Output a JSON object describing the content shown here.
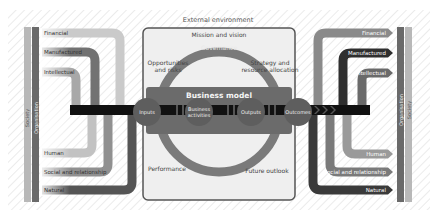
{
  "title": "External environment",
  "center": {
    "mission": "Mission and vision",
    "governance": "Governance",
    "opportunities_line1": "Opportunities",
    "opportunities_line2": "and risks",
    "strategy_line1": "Strategy and",
    "strategy_line2": "resource allocation",
    "business_model": "Business model",
    "inputs": "Inputs",
    "activities_line1": "Business",
    "activities_line2": "activities",
    "outputs": "Outputs",
    "outcomes": "Outcomes",
    "performance": "Performance",
    "outlook": "Future outlook"
  },
  "left_capitals": [
    "Financial",
    "Manufactured",
    "Intellectual",
    "Human",
    "Social and relationship",
    "Natural"
  ],
  "right_capitals": [
    "Financial",
    "Manufactured",
    "Intellectual",
    "Human",
    "Social and relationship",
    "Natural"
  ],
  "left_bars": {
    "society": "Society",
    "organisation": "Organisation"
  },
  "right_bars": {
    "society": "Society",
    "organisation": "Organisation"
  },
  "colors": {
    "financial": "#c9c9c9",
    "manufactured": "#6e6e6e",
    "intellectual": "#a5a5a5",
    "human": "#bdbdbd",
    "social": "#8c8c8c",
    "natural": "#5a5a5a",
    "main_flow": "#111111",
    "circle_node": "#5e5e5e",
    "business_model_band": "#6b6b6b",
    "arc": "#777777",
    "panel_bg": "#eeeeee",
    "panel_border": "#555555"
  }
}
